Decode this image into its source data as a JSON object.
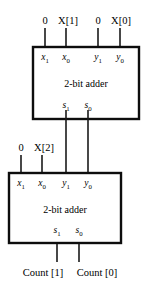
{
  "diagram": {
    "background_color": "#ffffff",
    "line_color": "#1a1a1a",
    "box_border_color": "#0d0d0d",
    "adders": [
      {
        "id": "upper-adder",
        "label": "2-bit adder",
        "input_pins": [
          "x",
          "x",
          "y",
          "y"
        ],
        "input_pin_subscripts": [
          "1",
          "0",
          "1",
          "0"
        ],
        "output_pins": [
          "s",
          "s"
        ],
        "output_pin_subscripts": [
          "1",
          "0"
        ],
        "top_inputs": [
          "0",
          "X[1]",
          "0",
          "X[0]"
        ]
      },
      {
        "id": "lower-adder",
        "label": "2-bit adder",
        "input_pins": [
          "x",
          "x",
          "y",
          "y"
        ],
        "input_pin_subscripts": [
          "1",
          "0",
          "1",
          "0"
        ],
        "output_pins": [
          "s",
          "s"
        ],
        "output_pin_subscripts": [
          "1",
          "0"
        ],
        "top_inputs": [
          "0",
          "X[2]"
        ]
      }
    ],
    "outputs": [
      "Count [1]",
      "Count [0]"
    ]
  }
}
